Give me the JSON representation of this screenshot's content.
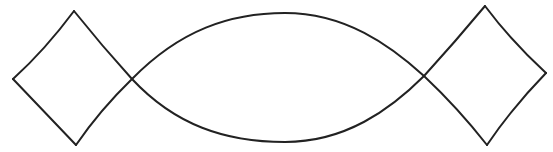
{
  "figure": {
    "background": "#ffffff",
    "stroke_color": "#222222",
    "stroke_width": 2,
    "shapes": [
      {
        "name": "left-diamond",
        "type": "diamond",
        "vertices": {
          "top": [
            74,
            11
          ],
          "left": [
            13,
            79
          ],
          "bottom": [
            76,
            145
          ],
          "right": [
            132,
            79
          ]
        }
      },
      {
        "name": "center-lens",
        "type": "lens",
        "left_point": [
          132,
          79
        ],
        "right_point": [
          424,
          76
        ],
        "top_extent": 13,
        "bottom_extent": 142
      },
      {
        "name": "right-diamond",
        "type": "diamond",
        "vertices": {
          "top": [
            485,
            6
          ],
          "right": [
            546,
            73
          ],
          "bottom": [
            487,
            145
          ],
          "left": [
            424,
            76
          ]
        }
      }
    ]
  }
}
